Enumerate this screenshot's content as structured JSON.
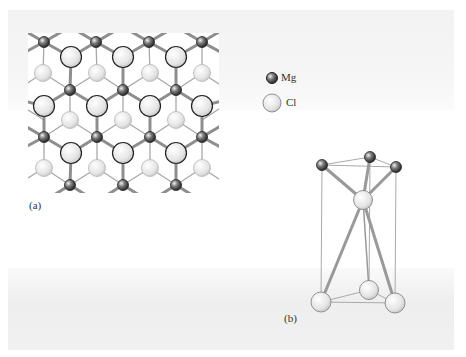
{
  "figure": {
    "panel_a_label": "(a)",
    "panel_b_label": "(b)"
  },
  "legend": {
    "items": [
      {
        "label": "Mg",
        "icon": "small-dark-sphere"
      },
      {
        "label": "Cl",
        "icon": "large-light-sphere"
      }
    ]
  },
  "colors": {
    "mg_sphere": "#555555",
    "cl_sphere": "#e6e6e6",
    "bond": "#999999",
    "cell_edge": "#aaaaaa"
  }
}
